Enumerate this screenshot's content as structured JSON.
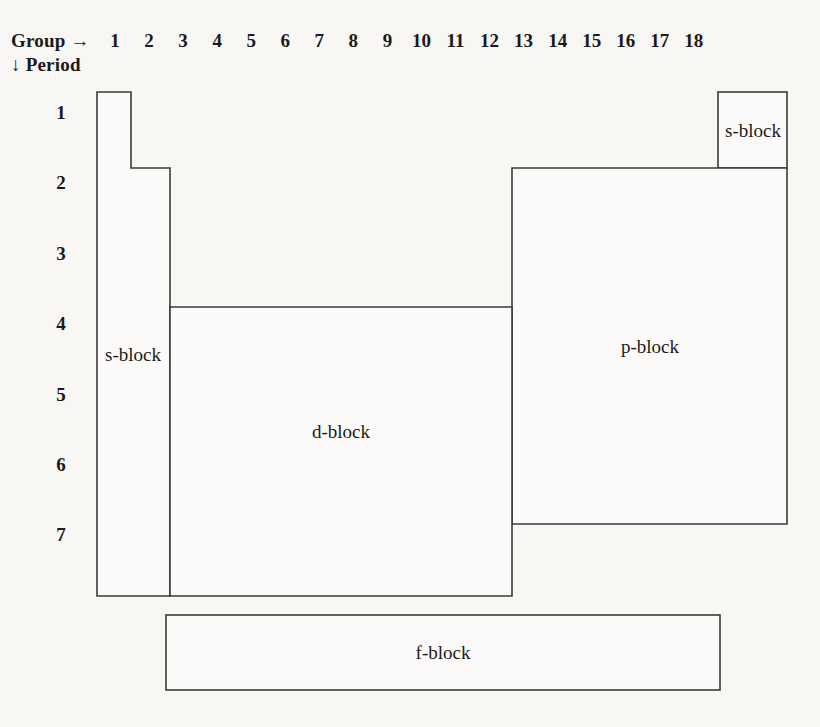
{
  "figure": {
    "kind": "periodic-table-block-diagram",
    "background_color": "#f8f7f4",
    "line_color": "#3b3b3b"
  },
  "axes": {
    "group_label": "Group →",
    "period_label": "↓ Period",
    "group_numbers": [
      "1",
      "2",
      "3",
      "4",
      "5",
      "6",
      "7",
      "8",
      "9",
      "10",
      "11",
      "12",
      "13",
      "14",
      "15",
      "16",
      "17",
      "18"
    ],
    "period_numbers": [
      "1",
      "2",
      "3",
      "4",
      "5",
      "6",
      "7"
    ]
  },
  "blocks": [
    {
      "id": "s-block-left",
      "label": "s-block",
      "groups": "1-2",
      "periods": "1-7"
    },
    {
      "id": "s-block-right",
      "label": "s-block",
      "groups": "18",
      "periods": "1"
    },
    {
      "id": "p-block",
      "label": "p-block",
      "groups": "13-18",
      "periods": "2-7"
    },
    {
      "id": "d-block",
      "label": "d-block",
      "groups": "3-12",
      "periods": "4-7"
    },
    {
      "id": "f-block",
      "label": "f-block",
      "groups": "",
      "periods": ""
    }
  ]
}
